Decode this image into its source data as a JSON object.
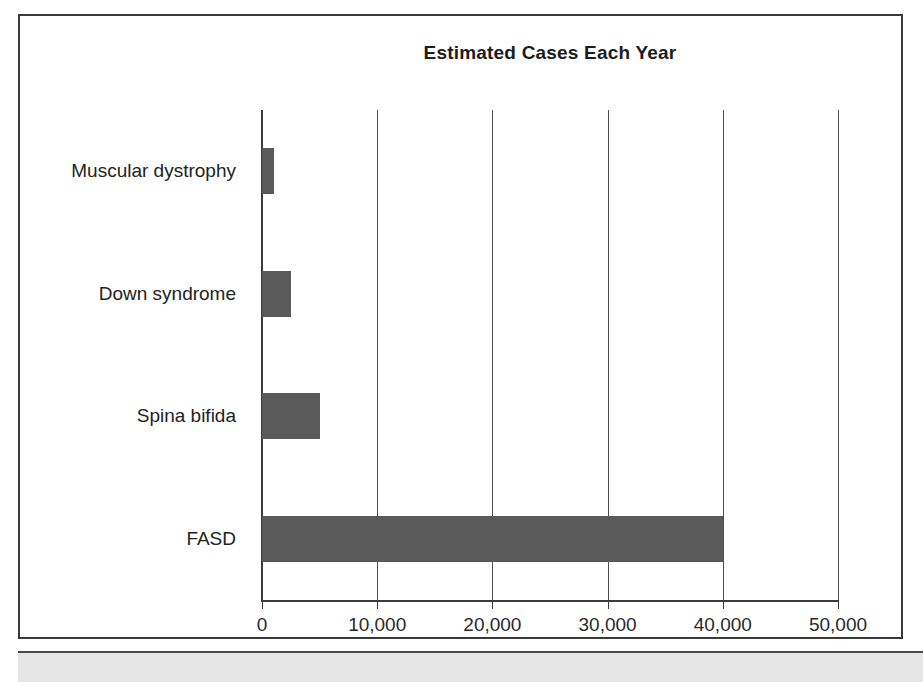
{
  "figure": {
    "background_color": "#ffffff",
    "border_color": "#3a3a3a",
    "bottom_strip_color": "#e6e6e6"
  },
  "chart_data": {
    "type": "bar",
    "orientation": "horizontal",
    "title": "Estimated Cases Each Year",
    "xlabel": "",
    "ylabel": "",
    "categories": [
      "Muscular dystrophy",
      "Down syndrome",
      "Spina bifida",
      "FASD"
    ],
    "values": [
      1000,
      2500,
      5000,
      40000
    ],
    "series": [
      {
        "name": "Estimated Cases Each Year",
        "values": [
          1000,
          2500,
          5000,
          40000
        ]
      }
    ],
    "xlim": [
      0,
      50000
    ],
    "xticks": [
      0,
      10000,
      20000,
      30000,
      40000,
      50000
    ],
    "xtick_labels": [
      "0",
      "10,000",
      "20,000",
      "30,000",
      "40,000",
      "50,000"
    ],
    "grid": true,
    "grid_axis": "x",
    "legend": false,
    "bar_color": "#5a5a5a",
    "axis_color": "#3c3c3c",
    "gridline_color": "#4e4e4e"
  }
}
